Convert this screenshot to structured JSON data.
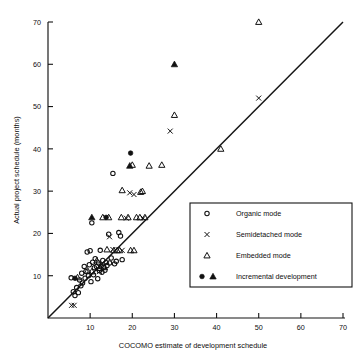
{
  "chart_data": {
    "type": "scatter",
    "title": "",
    "xlabel": "COCOMO estimate of development schedule",
    "ylabel": "Actual project schedule (months)",
    "xlim": [
      0,
      72
    ],
    "ylim": [
      0,
      72
    ],
    "xticks": [
      10,
      20,
      30,
      40,
      50,
      60,
      70
    ],
    "xtick_labels": [
      "10",
      "20",
      "30",
      "40",
      "50",
      "60",
      "70"
    ],
    "yticks": [
      10,
      20,
      30,
      40,
      50,
      60,
      70
    ],
    "ytick_labels": [
      "10",
      "20",
      "30",
      "40",
      "50",
      "60",
      "70"
    ],
    "grid": false,
    "reference_line": {
      "name": "y-equals-x",
      "from": [
        0,
        0
      ],
      "to": [
        70,
        70
      ]
    },
    "legend_position": "lower-right",
    "series": [
      {
        "name": "Organic mode",
        "marker": "open-circle",
        "points": [
          [
            5.5,
            9.5
          ],
          [
            6.0,
            6.2
          ],
          [
            6.4,
            5.3
          ],
          [
            6.8,
            7.2
          ],
          [
            7.2,
            6.0
          ],
          [
            7.5,
            9.0
          ],
          [
            7.8,
            7.6
          ],
          [
            8.0,
            10.6
          ],
          [
            8.2,
            8.3
          ],
          [
            8.6,
            12.2
          ],
          [
            8.8,
            9.4
          ],
          [
            9.0,
            11.0
          ],
          [
            9.3,
            15.6
          ],
          [
            9.6,
            10.0
          ],
          [
            9.8,
            12.6
          ],
          [
            10.0,
            15.9
          ],
          [
            10.2,
            8.6
          ],
          [
            10.4,
            22.5
          ],
          [
            10.6,
            13.2
          ],
          [
            10.8,
            10.2
          ],
          [
            11.0,
            11.9
          ],
          [
            11.2,
            14.0
          ],
          [
            11.5,
            12.2
          ],
          [
            11.8,
            9.3
          ],
          [
            12.0,
            13.0
          ],
          [
            12.2,
            11.2
          ],
          [
            12.4,
            16.0
          ],
          [
            12.6,
            12.3
          ],
          [
            12.8,
            10.8
          ],
          [
            13.0,
            13.6
          ],
          [
            13.2,
            12.0
          ],
          [
            13.5,
            11.3
          ],
          [
            13.8,
            13.1
          ],
          [
            14.0,
            12.4
          ],
          [
            14.4,
            19.8
          ],
          [
            14.6,
            13.0
          ],
          [
            15.0,
            14.2
          ],
          [
            15.4,
            34.2
          ],
          [
            15.8,
            12.8
          ],
          [
            16.2,
            13.4
          ],
          [
            16.8,
            20.2
          ],
          [
            17.2,
            19.4
          ],
          [
            17.6,
            13.8
          ]
        ]
      },
      {
        "name": "Semidetached mode",
        "marker": "x",
        "points": [
          [
            5.6,
            3.0
          ],
          [
            6.2,
            3.0
          ],
          [
            12.2,
            11.0
          ],
          [
            14.6,
            19.2
          ],
          [
            15.4,
            16.2
          ],
          [
            17.6,
            16.0
          ],
          [
            18.6,
            23.6
          ],
          [
            19.4,
            29.6
          ],
          [
            20.4,
            29.2
          ],
          [
            22.6,
            23.6
          ],
          [
            29.0,
            44.2
          ],
          [
            50.0,
            52.0
          ]
        ]
      },
      {
        "name": "Embedded mode",
        "marker": "open-triangle",
        "points": [
          [
            7.0,
            9.6
          ],
          [
            9.4,
            11.2
          ],
          [
            10.4,
            11.0
          ],
          [
            11.6,
            13.6
          ],
          [
            12.2,
            11.8
          ],
          [
            13.0,
            23.8
          ],
          [
            13.4,
            12.0
          ],
          [
            14.0,
            16.2
          ],
          [
            14.4,
            23.8
          ],
          [
            15.6,
            16.0
          ],
          [
            16.4,
            16.0
          ],
          [
            17.0,
            16.0
          ],
          [
            17.4,
            23.8
          ],
          [
            19.0,
            23.8
          ],
          [
            19.6,
            16.0
          ],
          [
            20.4,
            16.0
          ],
          [
            21.0,
            23.8
          ],
          [
            21.8,
            23.8
          ],
          [
            22.4,
            30.0
          ],
          [
            23.0,
            23.8
          ],
          [
            17.6,
            30.2
          ],
          [
            20.0,
            36.2
          ],
          [
            22.0,
            29.8
          ],
          [
            24.0,
            36.0
          ],
          [
            27.0,
            36.2
          ],
          [
            30.0,
            48.0
          ],
          [
            41.0,
            40.0
          ],
          [
            50.0,
            70.0
          ]
        ]
      },
      {
        "name": "Incremental development",
        "marker": "filled-circle-and-filled-triangle",
        "points": [
          [
            6.4,
            9.4
          ],
          [
            10.4,
            23.8
          ],
          [
            13.8,
            23.8
          ],
          [
            19.4,
            36.0
          ],
          [
            19.6,
            39.0
          ],
          [
            30.0,
            60.0
          ]
        ]
      }
    ]
  },
  "legend": {
    "entries": [
      {
        "label": "Organic mode",
        "marker": "open-circle"
      },
      {
        "label": "Semidetached mode",
        "marker": "x"
      },
      {
        "label": "Embedded mode",
        "marker": "open-triangle"
      },
      {
        "label": "Incremental development",
        "marker": "filled-circle-filled-triangle"
      }
    ]
  },
  "colors": {
    "ink": "#141414",
    "background": "#ffffff"
  }
}
